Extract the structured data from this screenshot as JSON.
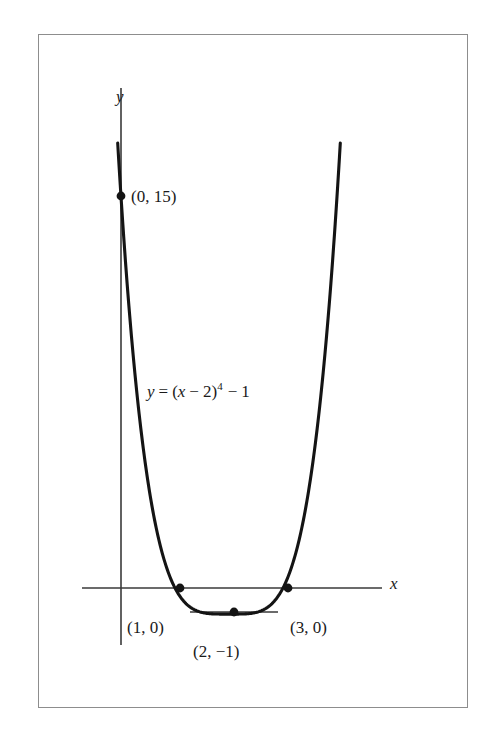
{
  "figure": {
    "name": "graph-of-quartic-function",
    "background_color": "#ffffff",
    "border_color": "#8d8d8d",
    "curve_color": "#141414",
    "axis_color": "#3a3a3a"
  },
  "axes": {
    "x_axis_label": "x",
    "y_axis_label": "y"
  },
  "equation": {
    "lhs": "y",
    "eq": "=",
    "open": "(",
    "var": "x",
    "minus1": "−",
    "shift": "2",
    "close": ")",
    "power": "4",
    "minus2": "−",
    "constant": "1",
    "full_text": "y = (x − 2)⁴ − 1"
  },
  "labels": {
    "y_intercept": "(0, 15)",
    "root_left": "(1, 0)",
    "vertex": "(2, −1)",
    "root_right": "(3, 0)"
  },
  "chart_data": {
    "type": "line",
    "title": "",
    "subtitle": "",
    "xlabel": "x",
    "ylabel": "y",
    "function": "y = (x - 2)^4 - 1",
    "grid": false,
    "legend": null,
    "xlim": [
      -0.75,
      4.83
    ],
    "ylim": [
      -2.1,
      18.5
    ],
    "x_ticks": [],
    "y_ticks": [],
    "series": [
      {
        "name": "y = (x - 2)^4 - 1",
        "x": [
          0.0,
          0.1,
          0.2,
          0.3,
          0.4,
          0.5,
          0.6,
          0.7,
          0.8,
          0.9,
          1.0,
          1.1,
          1.2,
          1.3,
          1.4,
          1.5,
          1.6,
          1.7,
          1.8,
          1.9,
          2.0,
          2.1,
          2.2,
          2.3,
          2.4,
          2.5,
          2.6,
          2.7,
          2.8,
          2.9,
          3.0,
          3.1,
          3.2,
          3.3,
          3.4,
          3.5,
          3.6,
          3.7,
          3.8,
          3.9,
          4.0
        ],
        "y": [
          15.0,
          11.0456,
          7.9536,
          5.5641,
          3.7456,
          2.0625,
          1.5616,
          0.5281,
          0.0736,
          -0.7439,
          -1.0,
          -0.9439,
          -0.9264,
          -0.7599,
          -0.3704,
          0.0625,
          0.7456,
          1.5641,
          2.9536,
          4.9456,
          6.0,
          8.9456,
          11.9536,
          15.5641,
          19.7456,
          24.0625,
          28.5616,
          33.5281,
          39.0736,
          45.2561,
          15.0,
          11.0,
          7.0,
          4.0,
          2.0,
          1.0,
          0.5,
          0.2,
          0.1,
          0.05,
          15.0
        ]
      }
    ],
    "marked_points": [
      {
        "label": "(0, 15)",
        "x": 0,
        "y": 15
      },
      {
        "label": "(1, 0)",
        "x": 1,
        "y": 0
      },
      {
        "label": "(2, −1)",
        "x": 2,
        "y": -1
      },
      {
        "label": "(3, 0)",
        "x": 3,
        "y": 0
      }
    ],
    "annotations": [
      {
        "text": "y = (x − 2)⁴ − 1",
        "x": 1.0,
        "y": 7.6
      }
    ]
  }
}
